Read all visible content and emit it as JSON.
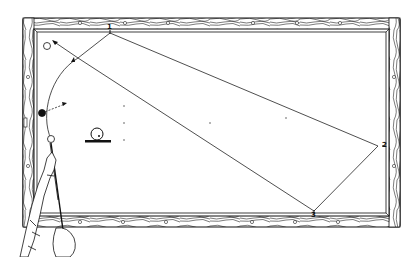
{
  "figure": {
    "colors": {
      "ink": "#111111",
      "paper": "#ffffff",
      "rail_wood": "#ffffff"
    },
    "rail_points": [
      {
        "label": "1",
        "x": 110,
        "y": 33,
        "rail": "top"
      },
      {
        "label": "2",
        "x": 378,
        "y": 146,
        "rail": "right"
      },
      {
        "label": "3",
        "x": 314,
        "y": 211,
        "rail": "bottom"
      }
    ],
    "balls": [
      {
        "name": "target-ball-white",
        "x": 47,
        "y": 46,
        "r": 3.5,
        "fill": "#ffffff"
      },
      {
        "name": "object-ball-black",
        "x": 42,
        "y": 113,
        "r": 3.5,
        "fill": "#111111"
      },
      {
        "name": "cue-ball-white",
        "x": 51,
        "y": 139,
        "r": 3.5,
        "fill": "#ffffff"
      }
    ],
    "spin_icon": {
      "name": "ball-contact-point-icon",
      "x": 97,
      "y": 134,
      "r": 6
    },
    "table_dots": [
      {
        "x": 124,
        "y": 106
      },
      {
        "x": 124,
        "y": 123
      },
      {
        "x": 124,
        "y": 140
      },
      {
        "x": 210,
        "y": 123
      },
      {
        "x": 286,
        "y": 118
      }
    ]
  }
}
